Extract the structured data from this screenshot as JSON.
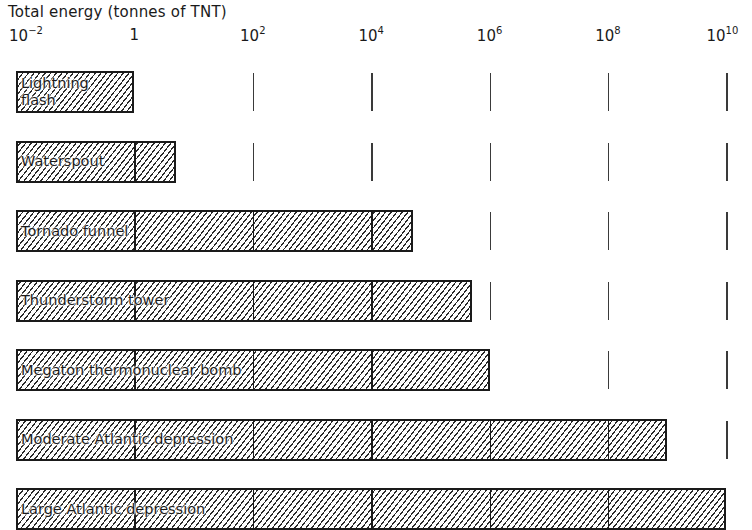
{
  "chart_data": {
    "type": "bar",
    "orientation": "horizontal",
    "title": "Total energy (tonnes of TNT)",
    "xlabel": "Total energy (tonnes of TNT)",
    "ylabel": "",
    "xscale": "log",
    "xlim": [
      0.01,
      10000000000
    ],
    "x_ticks": [
      "10^-2",
      "1",
      "10^2",
      "10^4",
      "10^6",
      "10^8",
      "10^10"
    ],
    "x_tick_values": [
      0.01,
      1,
      100,
      10000,
      1000000,
      100000000,
      10000000000
    ],
    "grid": "vertical dashes at each tick",
    "legend": "none",
    "categories": [
      "Lightning flash",
      "Waterspout",
      "Tornado funnel",
      "Thunderstorm tower",
      "Megaton thermonuclear bomb",
      "Moderate Atlantic depression",
      "Large Atlantic depression"
    ],
    "values": [
      1,
      5,
      50000,
      500000,
      1000000,
      1000000000,
      10000000000
    ],
    "bar_start": 0.01,
    "fill": "diagonal hatching"
  },
  "title": "Total energy (tonnes of TNT)",
  "ticks": [
    {
      "base": "10",
      "exp": "−2"
    },
    {
      "base": "1",
      "exp": ""
    },
    {
      "base": "10",
      "exp": "2"
    },
    {
      "base": "10",
      "exp": "4"
    },
    {
      "base": "10",
      "exp": "6"
    },
    {
      "base": "10",
      "exp": "8"
    },
    {
      "base": "10",
      "exp": "10"
    }
  ],
  "bars": [
    {
      "label": "Lightning\nflash"
    },
    {
      "label": "Waterspout"
    },
    {
      "label": "Tornado funnel"
    },
    {
      "label": "Thunderstorm tower"
    },
    {
      "label": "Megaton thermonuclear bomb"
    },
    {
      "label": "Moderate Atlantic depression"
    },
    {
      "label": "Large Atlantic depression"
    }
  ]
}
